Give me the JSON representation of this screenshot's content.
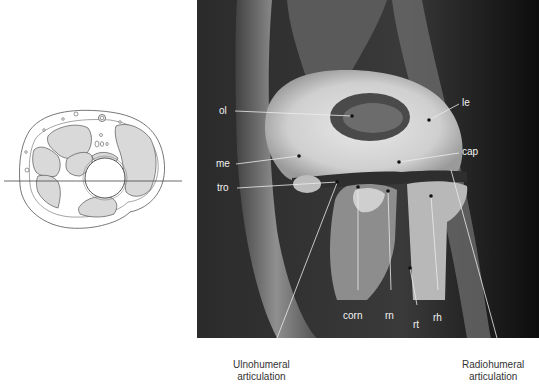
{
  "figure": {
    "cross_section": {
      "description": "Axial cross-section diagram of the elbow with horizontal plane line indicating MRI slice level"
    },
    "mri": {
      "description": "Coronal MRI of the elbow",
      "labels": {
        "ol": "ol",
        "le": "le",
        "me": "me",
        "cap": "cap",
        "tro": "tro",
        "corn": "corn",
        "rn": "rn",
        "rt": "rt",
        "rh": "rh"
      }
    },
    "captions": {
      "ulnohumeral_line1": "Ulnohumeral",
      "ulnohumeral_line2": "articulation",
      "radiohumeral_line1": "Radiohumeral",
      "radiohumeral_line2": "articulation"
    }
  }
}
